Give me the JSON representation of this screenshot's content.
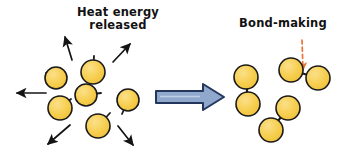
{
  "figure": {
    "type": "diagram",
    "background_color": "#ffffff",
    "width": 344,
    "height": 162
  },
  "labels": {
    "heat_line1": "Heat energy",
    "heat_line2": "released",
    "bond_making": "Bond-making"
  },
  "colors": {
    "atom_fill": "#F6CE4E",
    "atom_fill_light": "#FBE08A",
    "atom_stroke": "#1A1A1A",
    "bond_stroke": "#1A1A1A",
    "energy_arrow": "#1A1A1A",
    "reaction_arrow_fill": "#8FA8CC",
    "reaction_arrow_stroke": "#24365C",
    "pointer_dashed": "#E8753A",
    "text": "#121212"
  },
  "left_side": {
    "caption": "Heat energy released",
    "atom_count": 6,
    "atoms": [
      {
        "id": "atom-l1",
        "cx": 56,
        "cy": 78,
        "r": 11,
        "stub_angle_deg": 205
      },
      {
        "id": "atom-l2",
        "cx": 93,
        "cy": 72,
        "r": 12,
        "stub_angle_deg": 272
      },
      {
        "id": "atom-l3",
        "cx": 86,
        "cy": 95,
        "r": 11,
        "stub_angle_deg": 15
      },
      {
        "id": "atom-l4",
        "cx": 60,
        "cy": 108,
        "r": 12,
        "stub_angle_deg": 320
      },
      {
        "id": "atom-l5",
        "cx": 98,
        "cy": 126,
        "r": 12,
        "stub_angle_deg": 45
      },
      {
        "id": "atom-l6",
        "cx": 128,
        "cy": 100,
        "r": 11,
        "stub_angle_deg": 250
      }
    ],
    "energy_arrows": [
      {
        "id": "energy-arrow-up-left",
        "x1": 72,
        "y1": 60,
        "x2": 64,
        "y2": 35
      },
      {
        "id": "energy-arrow-up-right",
        "x1": 113,
        "y1": 62,
        "x2": 131,
        "y2": 42
      },
      {
        "id": "energy-arrow-left",
        "x1": 46,
        "y1": 93,
        "x2": 15,
        "y2": 93
      },
      {
        "id": "energy-arrow-down-left",
        "x1": 70,
        "y1": 125,
        "x2": 46,
        "y2": 146
      },
      {
        "id": "energy-arrow-down-right",
        "x1": 118,
        "y1": 126,
        "x2": 134,
        "y2": 147
      }
    ]
  },
  "reaction_arrow": {
    "id": "reaction-arrow",
    "direction": "right",
    "x_start": 155,
    "x_end": 224,
    "y": 97
  },
  "right_side": {
    "caption": "Bond-making",
    "molecule_count": 3,
    "molecules": [
      {
        "id": "molecule-r1",
        "orientation": "vertical",
        "atoms": [
          {
            "cx": 246,
            "cy": 77,
            "r": 12
          },
          {
            "cx": 248,
            "cy": 104,
            "r": 12
          }
        ]
      },
      {
        "id": "molecule-r2",
        "orientation": "horizontal-tilted",
        "atoms": [
          {
            "cx": 291,
            "cy": 70,
            "r": 12
          },
          {
            "cx": 318,
            "cy": 78,
            "r": 12
          }
        ]
      },
      {
        "id": "molecule-r3",
        "orientation": "diagonal",
        "atoms": [
          {
            "cx": 288,
            "cy": 108,
            "r": 12
          },
          {
            "cx": 271,
            "cy": 130,
            "r": 12
          }
        ]
      }
    ],
    "pointer": {
      "id": "bond-pointer",
      "style": "dashed",
      "x1": 302,
      "y1": 42,
      "x2": 303,
      "y2": 72
    }
  }
}
